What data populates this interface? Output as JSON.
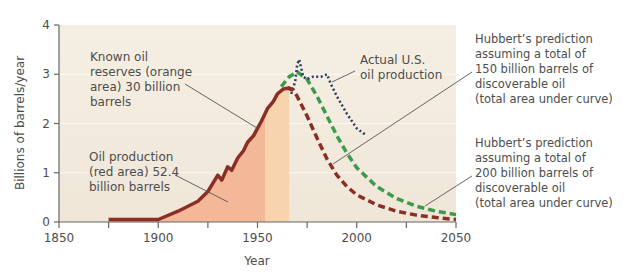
{
  "chart_data": {
    "type": "line",
    "title": "",
    "xlabel": "Year",
    "ylabel": "Billions of barrels/year",
    "xlim": [
      1850,
      2050
    ],
    "ylim": [
      0,
      4
    ],
    "x_ticks": [
      1850,
      1875,
      1900,
      1925,
      1950,
      1975,
      2000,
      2025,
      2050
    ],
    "x_tick_labels": [
      "1850",
      "1900",
      "1950",
      "2000",
      "2050"
    ],
    "y_ticks": [
      0,
      1,
      2,
      3,
      4
    ],
    "y_tick_labels": [
      "0",
      "1",
      "2",
      "3",
      "4"
    ],
    "grid": true,
    "series": [
      {
        "name": "Oil production (historical)",
        "style": "solid",
        "color": "#8B2E24",
        "x": [
          1875,
          1900,
          1910,
          1920,
          1925,
          1930,
          1932,
          1935,
          1937,
          1940,
          1943,
          1945,
          1948,
          1950,
          1952,
          1955,
          1958,
          1960,
          1963,
          1966,
          1968
        ],
        "y": [
          0.05,
          0.05,
          0.22,
          0.42,
          0.62,
          0.95,
          0.85,
          1.12,
          1.05,
          1.3,
          1.45,
          1.62,
          1.75,
          1.9,
          2.05,
          2.3,
          2.45,
          2.6,
          2.7,
          2.72,
          2.68
        ]
      },
      {
        "name": "Actual U.S. oil production",
        "style": "dotted",
        "color": "#2B3A67",
        "x": [
          1967,
          1969,
          1970,
          1971,
          1973,
          1975,
          1978,
          1982,
          1985,
          1987,
          1990,
          1995,
          2000,
          2005
        ],
        "y": [
          2.6,
          2.85,
          3.2,
          3.3,
          2.95,
          2.9,
          2.95,
          2.95,
          3.0,
          2.8,
          2.55,
          2.2,
          1.9,
          1.75
        ]
      },
      {
        "name": "Hubbert's prediction (150 billion barrels)",
        "style": "dashed",
        "color": "#8B2E24",
        "x": [
          1965,
          1968,
          1970,
          1975,
          1980,
          1985,
          1990,
          1995,
          2000,
          2010,
          2020,
          2030,
          2040,
          2050
        ],
        "y": [
          2.72,
          2.68,
          2.55,
          2.15,
          1.7,
          1.28,
          0.95,
          0.72,
          0.55,
          0.35,
          0.22,
          0.14,
          0.09,
          0.05
        ]
      },
      {
        "name": "Hubbert's prediction (200 billion barrels)",
        "style": "dashed",
        "color": "#3C9A4B",
        "x": [
          1962,
          1966,
          1970,
          1975,
          1980,
          1985,
          1990,
          1995,
          2000,
          2010,
          2020,
          2030,
          2040,
          2050
        ],
        "y": [
          2.75,
          2.95,
          3.05,
          2.9,
          2.55,
          2.15,
          1.75,
          1.4,
          1.1,
          0.72,
          0.48,
          0.32,
          0.22,
          0.15
        ]
      }
    ],
    "areas": [
      {
        "name": "Oil production (red area)",
        "x_range": [
          1875,
          1954
        ],
        "color": "#F3B898",
        "value": "52.4 billion barrels"
      },
      {
        "name": "Known oil reserves (orange area)",
        "x_range": [
          1954,
          1966
        ],
        "color": "#F7D4AD",
        "value": "30 billion barrels"
      }
    ],
    "annotations": [
      "Known oil reserves (orange area) 30 billion barrels",
      "Oil production (red area) 52.4 billion barrels",
      "Actual U.S. oil production",
      "Hubbert's prediction assuming a total of 150 billion barrels of discoverable oil (total area under curve)",
      "Hubbert's prediction assuming a total of 200 billion barrels of discoverable oil (total area under curve)"
    ],
    "legend_position": "none (inline annotations)"
  },
  "axes": {
    "ylabel": "Billions of barrels/year",
    "xlabel": "Year",
    "y_ticks": [
      "0",
      "1",
      "2",
      "3",
      "4"
    ],
    "x_ticks": [
      "1850",
      "1900",
      "1950",
      "2000",
      "2050"
    ]
  },
  "labels": {
    "reserves": [
      "Known oil",
      "reserves (orange",
      "area) 30 billion",
      "barrels"
    ],
    "production": [
      "Oil production",
      "(red area) 52.4",
      "billion barrels"
    ],
    "actual": [
      "Actual U.S.",
      "oil production"
    ],
    "hubbert150": [
      "Hubbert’s prediction",
      "assuming a total of",
      "150 billion barrels of",
      "discoverable oil",
      "(total area under curve)"
    ],
    "hubbert200": [
      "Hubbert’s prediction",
      "assuming a total of",
      "200 billion barrels of",
      "discoverable oil",
      "(total area under curve)"
    ]
  },
  "colors": {
    "plot_bg": "#F1EADD",
    "red_area": "#F3B898",
    "orange_area": "#F7D4AD",
    "production_line": "#8B2E24",
    "actual_line": "#2B3A67",
    "green_dashed": "#3C9A4B",
    "axis": "#666666"
  }
}
